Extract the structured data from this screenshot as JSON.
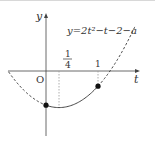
{
  "diagram": {
    "equation": "y=2t²−t−2−a",
    "axis_x_label": "t",
    "axis_y_label": "y",
    "origin_label": "O",
    "tick_quarter_num": "1",
    "tick_quarter_den": "4",
    "tick_one": "1",
    "curve": {
      "a2": 2,
      "a1": -1,
      "a0_symbolic": "-2-a",
      "solid_range": [
        0,
        1
      ],
      "vertex_t": 0.25
    },
    "points": [
      {
        "t": 0
      },
      {
        "t": 1
      }
    ],
    "guides": [
      {
        "t": 0.25
      },
      {
        "t": 1
      }
    ],
    "colors": {
      "ink": "#333333",
      "guide": "#999999"
    }
  }
}
